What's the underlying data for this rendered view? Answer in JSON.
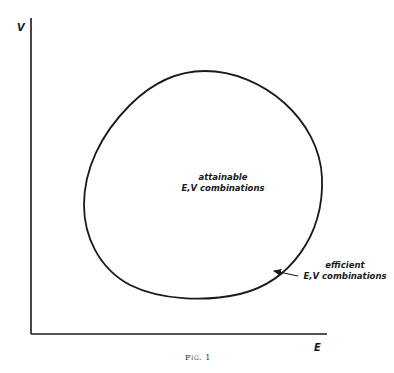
{
  "figure": {
    "caption": "Fig. 1",
    "y_axis_label": "V",
    "x_axis_label": "E",
    "region_label": {
      "line1": "attainable",
      "line2": "E,V combinations"
    },
    "efficient_label": {
      "line1": "efficient",
      "line2": "E,V combinations"
    },
    "colors": {
      "line": "#1a1a1a",
      "background": "#ffffff"
    }
  }
}
